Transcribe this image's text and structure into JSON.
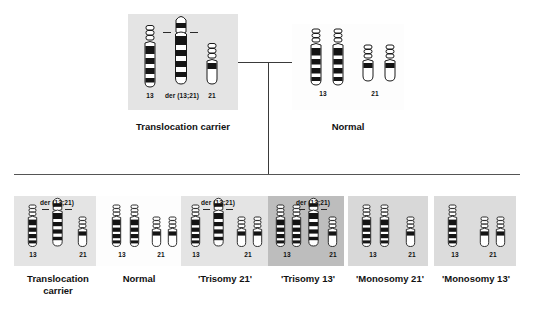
{
  "diagram": {
    "colors": {
      "band_dark": "#141414",
      "band_light": "#ffffff",
      "outline": "#1a1a1a",
      "panel_light": "#e4e4e4",
      "panel_medium": "#d8d8d8",
      "panel_dark": "#bdbdbd",
      "panel_white": "#fdfdfd",
      "line": "#3a3a3a"
    }
  },
  "parents": [
    {
      "id": "parent-translocation-carrier",
      "caption": "Translocation carrier",
      "shade": "light",
      "chromosomes": [
        {
          "name": "13",
          "type": "chr13",
          "label": "13"
        },
        {
          "name": "der(13;21)",
          "type": "der",
          "label": "der (13;21)"
        },
        {
          "name": "21",
          "type": "chr21",
          "label": "21"
        }
      ],
      "labels": [
        "13",
        "der (13;21)",
        "21"
      ]
    },
    {
      "id": "parent-normal",
      "caption": "Normal",
      "shade": "white",
      "chromosomes": [
        {
          "name": "13",
          "type": "chr13",
          "label": "13"
        },
        {
          "name": "13",
          "type": "chr13",
          "label": ""
        },
        {
          "name": "21",
          "type": "chr21",
          "label": "21"
        },
        {
          "name": "21",
          "type": "chr21",
          "label": ""
        }
      ],
      "labels": [
        "13",
        "21"
      ]
    }
  ],
  "offspring": [
    {
      "id": "offspring-translocation-carrier",
      "caption": "Translocation carrier",
      "caption_lines": [
        "Translocation",
        "carrier"
      ],
      "shade": "light",
      "der_label": "der (13;21)",
      "has_der": true,
      "label_13": "13",
      "label_21": "21",
      "count_13": 1,
      "count_21": 1
    },
    {
      "id": "offspring-normal",
      "caption": "Normal",
      "caption_lines": [
        "Normal"
      ],
      "shade": "white",
      "der_label": "",
      "has_der": false,
      "label_13": "13",
      "label_21": "21",
      "count_13": 2,
      "count_21": 2
    },
    {
      "id": "offspring-trisomy-21",
      "caption": "'Trisomy 21'",
      "caption_lines": [
        "'Trisomy 21'"
      ],
      "shade": "light",
      "der_label": "der (13;21)",
      "has_der": true,
      "label_13": "13",
      "label_21": "21",
      "count_13": 1,
      "count_21": 2
    },
    {
      "id": "offspring-trisomy-13",
      "caption": "'Trisomy 13'",
      "caption_lines": [
        "'Trisomy 13'"
      ],
      "shade": "dark",
      "der_label": "der (13;21)",
      "has_der": true,
      "label_13": "13",
      "label_21": "21",
      "count_13": 2,
      "count_21": 1
    },
    {
      "id": "offspring-monosomy-21",
      "caption": "'Monosomy 21'",
      "caption_lines": [
        "'Monosomy 21'"
      ],
      "shade": "medium",
      "der_label": "",
      "has_der": false,
      "label_13": "13",
      "label_21": "21",
      "count_13": 2,
      "count_21": 1
    },
    {
      "id": "offspring-monosomy-13",
      "caption": "'Monosomy 13'",
      "caption_lines": [
        "'Monosomy 13'"
      ],
      "shade": "medium",
      "der_label": "",
      "has_der": false,
      "label_13": "13",
      "label_21": "21",
      "count_13": 1,
      "count_21": 2
    }
  ]
}
